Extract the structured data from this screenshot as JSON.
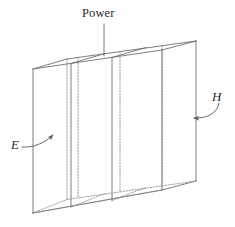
{
  "figure": {
    "type": "line-diagram",
    "canvas": {
      "width": 235,
      "height": 227
    },
    "background_color": "#ffffff",
    "stroke_color": "#6f6f6f",
    "hidden_stroke_color": "#8a8a8a",
    "label_color": "#2b2b2b",
    "labels": [
      {
        "id": "power",
        "text": "Power",
        "style": "serif-upright",
        "anchor_x": 103,
        "anchor_y": 14,
        "leader": {
          "kind": "straight-line",
          "from_x": 104,
          "from_y": 24,
          "to_x": 104,
          "to_y": 56
        }
      },
      {
        "id": "e-field",
        "text": "E",
        "style": "serif-italic",
        "anchor_x": 15,
        "anchor_y": 145,
        "leader": {
          "kind": "curved-arrow",
          "from_x": 24,
          "from_y": 146,
          "to_x": 56,
          "to_y": 133
        }
      },
      {
        "id": "h-field",
        "text": "H",
        "style": "serif-italic",
        "anchor_x": 217,
        "anchor_y": 97,
        "leader": {
          "kind": "curved-arrow",
          "from_x": 220,
          "from_y": 104,
          "to_x": 190,
          "to_y": 118
        }
      }
    ],
    "geometry": {
      "front_face": {
        "x_left": 33,
        "x_right": 162,
        "y_top_left": 69,
        "y_top_right": 50,
        "y_bottom_left": 213,
        "y_bottom_right": 190
      },
      "depth_offset": {
        "dx": 34,
        "dy": -10
      },
      "front_partitions_x": [
        71,
        112
      ],
      "back_partitions_x": [
        78,
        120,
        162
      ],
      "top_face_points": "33,69 162,50 196,41 67,59"
    }
  }
}
